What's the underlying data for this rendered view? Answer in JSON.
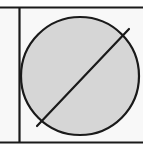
{
  "canvas": {
    "width": 143,
    "height": 149,
    "background_color": "#ffffff",
    "outside_fill_color": "#f8f8f8"
  },
  "figure": {
    "type": "geometric-diagram",
    "stroke_color": "#1a1a1a",
    "circle_fill_color": "#d6d6d6"
  },
  "chart_data": {
    "type": "scatter",
    "title": "",
    "subtitle": "",
    "xlabel": "",
    "ylabel": "",
    "grid": false,
    "legend": null,
    "xlim": [
      0,
      143
    ],
    "ylim": [
      0,
      149
    ],
    "annotations": [],
    "shapes": [
      {
        "name": "frame-top-line",
        "kind": "line",
        "x1": 0,
        "y1": 7.5,
        "x2": 143,
        "y2": 7.5,
        "stroke": "#1a1a1a",
        "stroke_width": 2.2
      },
      {
        "name": "frame-bottom-line",
        "kind": "line",
        "x1": 0,
        "y1": 142.5,
        "x2": 143,
        "y2": 142.5,
        "stroke": "#1a1a1a",
        "stroke_width": 2.2
      },
      {
        "name": "frame-left-vertical-line",
        "kind": "line",
        "x1": 19.5,
        "y1": 7.5,
        "x2": 19.5,
        "y2": 142.5,
        "stroke": "#1a1a1a",
        "stroke_width": 2.2
      },
      {
        "name": "shaded-circle",
        "kind": "circle",
        "cx": 80,
        "cy": 76,
        "r": 59,
        "fill": "#d6d6d6",
        "stroke": "#1a1a1a",
        "stroke_width": 2.2
      },
      {
        "name": "diagonal-chord",
        "kind": "line",
        "x1": 37,
        "y1": 126,
        "x2": 129,
        "y2": 29,
        "stroke": "#1a1a1a",
        "stroke_width": 2.2
      }
    ]
  }
}
